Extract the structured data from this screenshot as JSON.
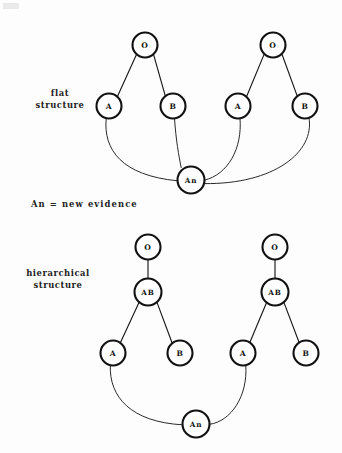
{
  "figure": {
    "background_color": "#fdfdfd",
    "node_stroke_color": "#111111",
    "edge_color": "#1a1a1a",
    "text_color": "#222222"
  },
  "labels": {
    "flat_structure": {
      "line1": "flat",
      "line2": "structure"
    },
    "hierarchical_structure": {
      "line1": "hierarchical",
      "line2": "structure"
    },
    "legend": "An  =  new  evidence"
  },
  "diagrams": [
    {
      "id": "flat-structure",
      "name": "flat structure",
      "side_label_lines": [
        "flat",
        "structure"
      ],
      "trees": [
        {
          "id": "flat-left",
          "nodes": [
            {
              "id": "flat-left-o",
              "label": "O",
              "cx": 145,
              "cy": 45,
              "r": 12.5
            },
            {
              "id": "flat-left-a",
              "label": "A",
              "cx": 109,
              "cy": 106,
              "r": 12.5
            },
            {
              "id": "flat-left-b",
              "label": "B",
              "cx": 173,
              "cy": 106,
              "r": 12.5
            }
          ]
        },
        {
          "id": "flat-right",
          "nodes": [
            {
              "id": "flat-right-o",
              "label": "O",
              "cx": 273,
              "cy": 45,
              "r": 12.5
            },
            {
              "id": "flat-right-a",
              "label": "A",
              "cx": 238,
              "cy": 106,
              "r": 12.5
            },
            {
              "id": "flat-right-b",
              "label": "B",
              "cx": 305,
              "cy": 106,
              "r": 12.5
            }
          ]
        }
      ],
      "evidence_node": {
        "id": "flat-an",
        "label": "An",
        "cx": 191,
        "cy": 180,
        "r": 13.5
      }
    },
    {
      "id": "hierarchical-structure",
      "name": "hierarchical structure",
      "side_label_lines": [
        "hierarchical",
        "structure"
      ],
      "trees": [
        {
          "id": "hier-left",
          "nodes": [
            {
              "id": "hier-left-o",
              "label": "O",
              "cx": 148,
              "cy": 247,
              "r": 12.5
            },
            {
              "id": "hier-left-ab",
              "label": "AB",
              "cx": 148,
              "cy": 292,
              "r": 13.5
            },
            {
              "id": "hier-left-a",
              "label": "A",
              "cx": 113,
              "cy": 353,
              "r": 12.5
            },
            {
              "id": "hier-left-b",
              "label": "B",
              "cx": 180,
              "cy": 353,
              "r": 12.5
            }
          ]
        },
        {
          "id": "hier-right",
          "nodes": [
            {
              "id": "hier-right-o",
              "label": "O",
              "cx": 275,
              "cy": 247,
              "r": 12.5
            },
            {
              "id": "hier-right-ab",
              "label": "AB",
              "cx": 275,
              "cy": 292,
              "r": 13.5
            },
            {
              "id": "hier-right-a",
              "label": "A",
              "cx": 243,
              "cy": 353,
              "r": 12.5
            },
            {
              "id": "hier-right-b",
              "label": "B",
              "cx": 306,
              "cy": 353,
              "r": 12.5
            }
          ]
        }
      ],
      "evidence_node": {
        "id": "hier-an",
        "label": "An",
        "cx": 196,
        "cy": 424,
        "r": 13.5
      }
    }
  ]
}
